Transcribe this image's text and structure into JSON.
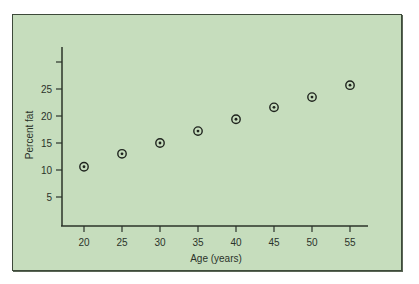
{
  "chart_data": {
    "type": "scatter",
    "title": "",
    "xlabel": "Age (years)",
    "ylabel": "Percent fat",
    "x_ticks": [
      20,
      25,
      30,
      35,
      40,
      45,
      50,
      55
    ],
    "y_ticks": [
      5,
      10,
      15,
      20,
      25,
      30
    ],
    "y_tick_labels": [
      "5",
      "10",
      "15",
      "20",
      "25",
      ""
    ],
    "x_tick_labels": [
      "20",
      "25",
      "30",
      "35",
      "40",
      "45",
      "50",
      "55"
    ],
    "xlim": [
      17,
      58
    ],
    "ylim": [
      0,
      33
    ],
    "grid": false,
    "legend": null,
    "marker": "circled-dot",
    "series": [
      {
        "name": "Percent fat by age",
        "x": [
          20,
          25,
          30,
          35,
          40,
          45,
          50,
          55
        ],
        "y": [
          10.6,
          13.0,
          15.0,
          17.2,
          19.4,
          21.6,
          23.5,
          25.7
        ]
      }
    ]
  },
  "colors": {
    "panel_background": "#c6ddbd",
    "axis": "#2b332a",
    "marker": "#1f241e"
  }
}
